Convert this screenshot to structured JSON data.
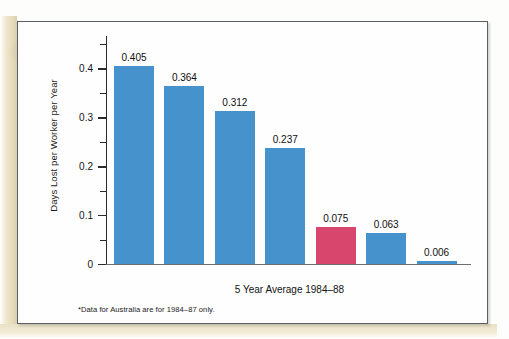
{
  "chart_data": {
    "type": "bar",
    "title": "",
    "subtitle": "5 Year Average 1984–88",
    "xlabel": "",
    "ylabel": "Days Lost per Worker per Year",
    "ylim": [
      0,
      0.45
    ],
    "grid": false,
    "legend": "none",
    "categories": [
      "Great Britain",
      "Canada",
      "Italy",
      "Australia*",
      "United States",
      "France",
      "Japan"
    ],
    "values": [
      0.405,
      0.364,
      0.312,
      0.237,
      0.075,
      0.063,
      0.006
    ],
    "value_labels": [
      "0.405",
      "0.364",
      "0.312",
      "0.237",
      "0.075",
      "0.063",
      "0.006"
    ],
    "highlight_index": 4,
    "colors": {
      "bar": "#4592cc",
      "accent": "#d9466d",
      "axis": "#2b2b2b",
      "text": "#111111",
      "frame": "#5a5f66"
    },
    "y_ticks_major": [
      {
        "value": 0,
        "label": "0"
      },
      {
        "value": 0.1,
        "label": "0.1"
      },
      {
        "value": 0.2,
        "label": "0.2"
      },
      {
        "value": 0.3,
        "label": "0.3"
      },
      {
        "value": 0.4,
        "label": "0.4"
      }
    ],
    "y_ticks_minor": [
      0.05,
      0.15,
      0.25,
      0.35,
      0.45
    ],
    "annotations": [
      "*Data for Australia are for 1984–87 only."
    ]
  },
  "figure": {
    "footnote": "*Data for Australia are for 1984–87 only."
  }
}
